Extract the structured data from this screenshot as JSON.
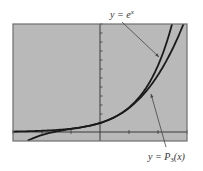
{
  "chart_data": {
    "type": "line",
    "title": "",
    "xlabel": "",
    "ylabel": "",
    "xlim": [
      -3,
      3
    ],
    "ylim": [
      -1,
      12
    ],
    "x_ticks": [
      -3,
      -2,
      -1,
      1,
      2,
      3
    ],
    "y_ticks": [
      1,
      2,
      3,
      4,
      5,
      6,
      7,
      8,
      9,
      10,
      11,
      12
    ],
    "grid": false,
    "colors": {
      "plot_background": "#b9b9b9",
      "frame": "#6e6e6e",
      "axis": "#3a3a3a",
      "curve": "#1a1a1a",
      "arrow": "#444444"
    },
    "series": [
      {
        "name": "y = e^x",
        "function": "exp(x)",
        "x": [
          -3,
          -2.5,
          -2,
          -1.5,
          -1,
          -0.5,
          0,
          0.5,
          1,
          1.5,
          2,
          2.25,
          2.5
        ],
        "y": [
          0.05,
          0.08,
          0.14,
          0.22,
          0.37,
          0.61,
          1.0,
          1.65,
          2.72,
          4.48,
          7.39,
          9.49,
          12.18
        ]
      },
      {
        "name": "y = P3(x)",
        "function": "1 + x + x^2/2 + x^3/6",
        "x": [
          -2.5,
          -2,
          -1.5,
          -1,
          -0.5,
          0,
          0.5,
          1,
          1.5,
          2,
          2.5,
          2.9
        ],
        "y": [
          -1.0,
          -0.33,
          0.06,
          0.33,
          0.6,
          1.0,
          1.65,
          2.67,
          4.19,
          6.33,
          9.23,
          12.17
        ]
      }
    ],
    "annotations": [
      {
        "id": "exp",
        "label_main": "y = e",
        "label_sup": "x",
        "points_to_series": "y = e^x",
        "position": "top"
      },
      {
        "id": "p3",
        "label_main": "y = P",
        "label_sub": "3",
        "label_tail": "(x)",
        "points_to_series": "y = P3(x)",
        "position": "bottom-right"
      }
    ]
  }
}
